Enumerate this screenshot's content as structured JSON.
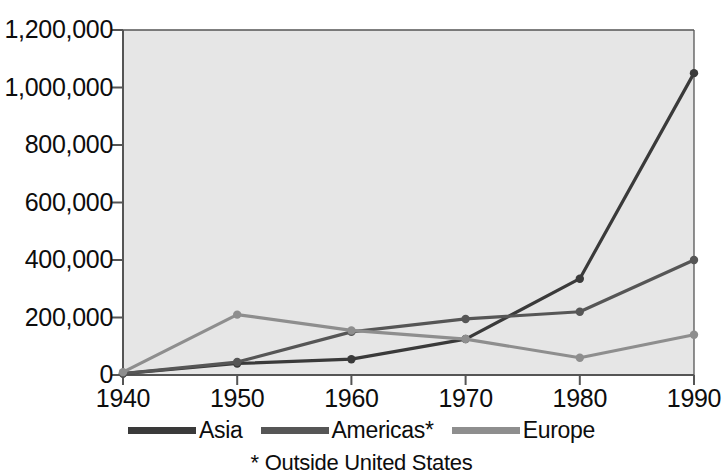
{
  "chart_data": {
    "type": "line",
    "title": "",
    "xlabel": "",
    "ylabel": "",
    "categories": [
      "1940",
      "1950",
      "1960",
      "1970",
      "1980",
      "1990"
    ],
    "x": [
      1940,
      1950,
      1960,
      1970,
      1980,
      1990
    ],
    "xlim": [
      1940,
      1990
    ],
    "ylim": [
      0,
      1200000
    ],
    "grid": false,
    "legend_position": "bottom",
    "series": [
      {
        "name": "Asia",
        "color": "#3a3a3a",
        "values": [
          5000,
          40000,
          55000,
          125000,
          335000,
          1050000
        ]
      },
      {
        "name": "Americas*",
        "color": "#565656",
        "values": [
          5000,
          45000,
          150000,
          195000,
          220000,
          400000
        ]
      },
      {
        "name": "Europe",
        "color": "#8e8e8e",
        "values": [
          10000,
          210000,
          155000,
          125000,
          60000,
          140000
        ]
      }
    ],
    "y_ticks": [
      0,
      200000,
      400000,
      600000,
      800000,
      1000000,
      1200000
    ],
    "y_tick_labels": [
      "0",
      "200,000",
      "400,000",
      "600,000",
      "800,000",
      "1,000,000",
      "1,200,000"
    ],
    "x_ticks": [
      1940,
      1950,
      1960,
      1970,
      1980,
      1990
    ],
    "x_tick_labels": [
      "1940",
      "1950",
      "1960",
      "1970",
      "1980",
      "1990"
    ],
    "annotations": [
      "* Outside United States"
    ],
    "plot_background": "#e6e6e6",
    "axis_color": "#555555"
  },
  "legend": {
    "items": [
      {
        "label": "Asia",
        "color": "#3a3a3a"
      },
      {
        "label": "Americas*",
        "color": "#565656"
      },
      {
        "label": "Europe",
        "color": "#8e8e8e"
      }
    ]
  },
  "footnote": {
    "text": "* Outside United States"
  }
}
